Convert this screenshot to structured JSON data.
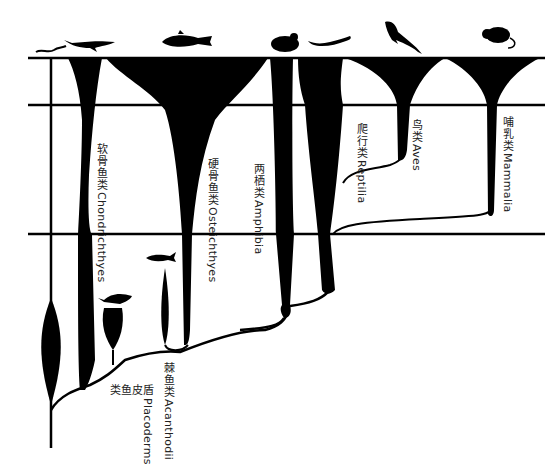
{
  "diagram": {
    "title": "",
    "type": "vertebrate evolution spindle diagram",
    "colors": {
      "ink": "#000000",
      "text": "#222222",
      "background": "#ffffff"
    },
    "time_lines_y": [
      58,
      105,
      234
    ],
    "groups": [
      {
        "id": "chondrichthyes",
        "zh": "软骨鱼类",
        "en": "Chondrichthyes",
        "icon": "shark-silhouette-icon"
      },
      {
        "id": "osteichthyes",
        "zh": "硬骨鱼类",
        "en": "Osteichthyes",
        "icon": "bony-fish-silhouette-icon"
      },
      {
        "id": "amphibia",
        "zh": "两栖类",
        "en": "Amphibia",
        "icon": "frog-silhouette-icon"
      },
      {
        "id": "reptilia",
        "zh": "爬行类",
        "en": "Reptilia",
        "icon": "lizard-silhouette-icon"
      },
      {
        "id": "aves",
        "zh": "鸟类",
        "en": "Aves",
        "icon": "swallow-bird-silhouette-icon"
      },
      {
        "id": "mammalia",
        "zh": "哺乳类",
        "en": "Mammalia",
        "icon": "mouse-silhouette-icon"
      },
      {
        "id": "acanthodii",
        "zh": "棘鱼类",
        "en": "Acanthodii",
        "icon": "acanthodian-fish-silhouette-icon"
      },
      {
        "id": "placoderms",
        "zh": "盾皮鱼类",
        "en": "Placoderms",
        "icon": "placoderm-fish-silhouette-icon"
      }
    ],
    "extra_icons": [
      "lamprey-eel-silhouette-icon"
    ]
  }
}
